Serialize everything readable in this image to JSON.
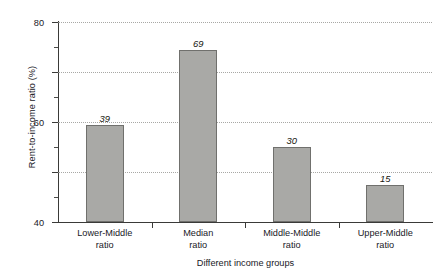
{
  "chart_data": {
    "type": "bar",
    "title": "",
    "subtitle": "",
    "xlabel": "Different income groups",
    "ylabel": "Rent-to-income ratio (%)",
    "categories": [
      "Lower-Middle ratio",
      "Median ratio",
      "Middle-Middle ratio",
      "Upper-Middle ratio"
    ],
    "category_lines": [
      [
        "Lower-Middle",
        "ratio"
      ],
      [
        "Median",
        "ratio"
      ],
      [
        "Middle-Middle",
        "ratio"
      ],
      [
        "Upper-Middle",
        "ratio"
      ]
    ],
    "values": [
      39,
      69,
      30,
      15
    ],
    "value_labels": [
      "39",
      "69",
      "30",
      "15"
    ],
    "ylim": [
      0,
      80
    ],
    "ytick_values": [
      0,
      20,
      40,
      60,
      80
    ],
    "ytick_labels": [
      "0",
      "20",
      "40",
      "60",
      "80"
    ],
    "yminor_tick_values": [
      10,
      30,
      50,
      70
    ],
    "grid": true,
    "grid_axis": "y",
    "grid_style": "dotted",
    "legend": false,
    "legend_position": "none",
    "bar_fill_color": "#a9a9a6",
    "bar_edge_color": "#70706d",
    "axis_color": "#3a3a38",
    "grid_color": "#9a9a96",
    "text_color": "#20201f",
    "background_color": "#ffffff",
    "value_label_style": "italic"
  }
}
